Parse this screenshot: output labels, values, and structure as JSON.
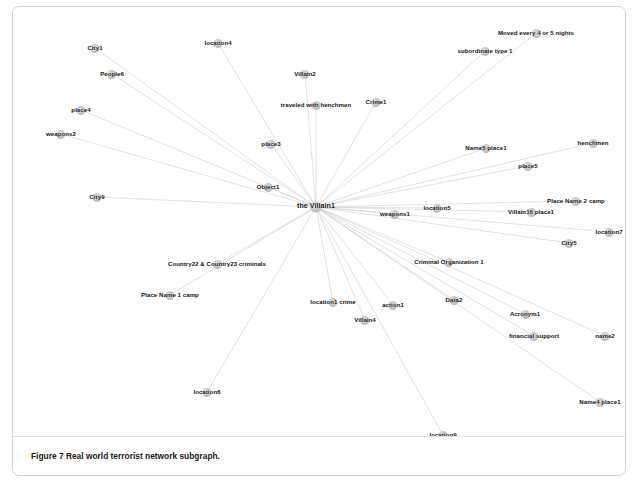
{
  "figure": {
    "caption_label": "Figure 7",
    "caption_text": "Real world terrorist network subgraph.",
    "panel_border_color": "#d2d2d2",
    "node_color": "#bdbdbd",
    "edge_color": "#c9c9c9",
    "label_color": "#141414",
    "background_color": "#ffffff"
  },
  "chart_data": {
    "type": "diagram",
    "subtype": "node-link-network-graph",
    "title": "Real world terrorist network subgraph",
    "layout": "radial star centred on hub node",
    "hub": "the Villain1",
    "node_count": 38,
    "edge_count": 37,
    "nodes": [
      {
        "id": "the Villain1",
        "label": "the Villain1",
        "x": 303,
        "y": 200,
        "hub": true
      },
      {
        "id": "City1",
        "label": "City1",
        "x": 82,
        "y": 41
      },
      {
        "id": "location4",
        "label": "location4",
        "x": 205,
        "y": 36
      },
      {
        "id": "Moved every 4 or 5 nights",
        "label": "Moved every 4 or 5 nights",
        "x": 523,
        "y": 26
      },
      {
        "id": "subordinate type 1",
        "label": "subordinate type 1",
        "x": 472,
        "y": 44
      },
      {
        "id": "People6",
        "label": "People6",
        "x": 99,
        "y": 67
      },
      {
        "id": "Villain2",
        "label": "Villain2",
        "x": 292,
        "y": 67
      },
      {
        "id": "place4",
        "label": "place4",
        "x": 68,
        "y": 103
      },
      {
        "id": "traveled with henchmen",
        "label": "traveled with henchmen",
        "x": 303,
        "y": 98
      },
      {
        "id": "Crime1",
        "label": "Crime1",
        "x": 363,
        "y": 95
      },
      {
        "id": "weapons2",
        "label": "weapons2",
        "x": 48,
        "y": 127
      },
      {
        "id": "place3",
        "label": "place3",
        "x": 258,
        "y": 137
      },
      {
        "id": "Name5 place1",
        "label": "Name5 place1",
        "x": 473,
        "y": 141
      },
      {
        "id": "henchmen",
        "label": "henchmen",
        "x": 580,
        "y": 136
      },
      {
        "id": "place5",
        "label": "place5",
        "x": 515,
        "y": 159
      },
      {
        "id": "Object1",
        "label": "Object1",
        "x": 255,
        "y": 180
      },
      {
        "id": "City9",
        "label": "City9",
        "x": 84,
        "y": 190
      },
      {
        "id": "Place Name 2 camp",
        "label": "Place Name 2 camp",
        "x": 563,
        "y": 194
      },
      {
        "id": "Villain16 place1",
        "label": "Villain16 place1",
        "x": 518,
        "y": 205
      },
      {
        "id": "weapons1",
        "label": "weapons1",
        "x": 382,
        "y": 207
      },
      {
        "id": "location5",
        "label": "location5",
        "x": 424,
        "y": 201
      },
      {
        "id": "location7",
        "label": "location7",
        "x": 596,
        "y": 225
      },
      {
        "id": "City5",
        "label": "City5",
        "x": 556,
        "y": 236
      },
      {
        "id": "Criminal Organization 1",
        "label": "Criminal Organization 1",
        "x": 436,
        "y": 255
      },
      {
        "id": "Country22 & Country23 criminals",
        "label": "Country22 & Country23 criminals",
        "x": 204,
        "y": 257
      },
      {
        "id": "Place Name 1 camp",
        "label": "Place Name 1 camp",
        "x": 157,
        "y": 288
      },
      {
        "id": "location1 crime",
        "label": "location1 crime",
        "x": 320,
        "y": 295
      },
      {
        "id": "action1",
        "label": "action1",
        "x": 380,
        "y": 298
      },
      {
        "id": "Data2",
        "label": "Data2",
        "x": 441,
        "y": 293
      },
      {
        "id": "Acronym1",
        "label": "Acronym1",
        "x": 512,
        "y": 307
      },
      {
        "id": "Villain4",
        "label": "Villain4",
        "x": 352,
        "y": 313
      },
      {
        "id": "financial support",
        "label": "financial support",
        "x": 521,
        "y": 329
      },
      {
        "id": "name2",
        "label": "name2",
        "x": 592,
        "y": 329
      },
      {
        "id": "location6",
        "label": "location6",
        "x": 194,
        "y": 385
      },
      {
        "id": "Name4 place1",
        "label": "Name4 place1",
        "x": 587,
        "y": 395
      },
      {
        "id": "location9",
        "label": "location9",
        "x": 430,
        "y": 428
      }
    ],
    "edges": [
      {
        "source": "the Villain1",
        "target": "City1"
      },
      {
        "source": "the Villain1",
        "target": "location4"
      },
      {
        "source": "the Villain1",
        "target": "Moved every 4 or 5 nights"
      },
      {
        "source": "the Villain1",
        "target": "subordinate type 1"
      },
      {
        "source": "the Villain1",
        "target": "People6"
      },
      {
        "source": "the Villain1",
        "target": "Villain2"
      },
      {
        "source": "the Villain1",
        "target": "place4"
      },
      {
        "source": "the Villain1",
        "target": "traveled with henchmen"
      },
      {
        "source": "the Villain1",
        "target": "Crime1"
      },
      {
        "source": "the Villain1",
        "target": "weapons2"
      },
      {
        "source": "the Villain1",
        "target": "place3"
      },
      {
        "source": "the Villain1",
        "target": "Name5 place1"
      },
      {
        "source": "the Villain1",
        "target": "henchmen"
      },
      {
        "source": "the Villain1",
        "target": "place5"
      },
      {
        "source": "the Villain1",
        "target": "Object1"
      },
      {
        "source": "the Villain1",
        "target": "City9"
      },
      {
        "source": "the Villain1",
        "target": "Place Name 2 camp"
      },
      {
        "source": "the Villain1",
        "target": "Villain16 place1"
      },
      {
        "source": "the Villain1",
        "target": "weapons1"
      },
      {
        "source": "the Villain1",
        "target": "location5"
      },
      {
        "source": "the Villain1",
        "target": "location7"
      },
      {
        "source": "the Villain1",
        "target": "City5"
      },
      {
        "source": "the Villain1",
        "target": "Criminal Organization 1"
      },
      {
        "source": "the Villain1",
        "target": "Country22 & Country23 criminals"
      },
      {
        "source": "the Villain1",
        "target": "Place Name 1 camp"
      },
      {
        "source": "the Villain1",
        "target": "location1 crime"
      },
      {
        "source": "the Villain1",
        "target": "action1"
      },
      {
        "source": "the Villain1",
        "target": "Data2"
      },
      {
        "source": "the Villain1",
        "target": "Acronym1"
      },
      {
        "source": "the Villain1",
        "target": "Villain4"
      },
      {
        "source": "the Villain1",
        "target": "financial support"
      },
      {
        "source": "the Villain1",
        "target": "name2"
      },
      {
        "source": "the Villain1",
        "target": "location6"
      },
      {
        "source": "the Villain1",
        "target": "Name4 place1"
      },
      {
        "source": "the Villain1",
        "target": "location9"
      }
    ]
  }
}
